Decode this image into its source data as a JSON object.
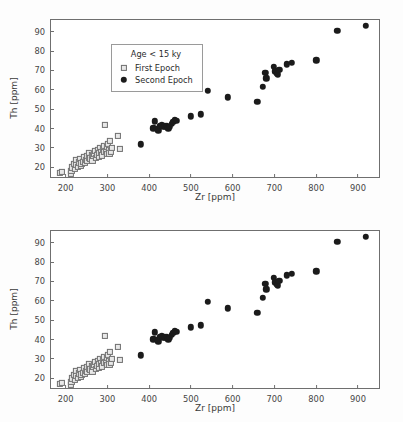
{
  "figure": {
    "axis_color": "#6f6f6f",
    "first_epoch_color": "#e8e8e8",
    "first_epoch_edge": "#707070",
    "second_epoch_color": "#1b1b1b"
  },
  "axes": {
    "xlabel": "Zr [ppm]",
    "ylabel": "Th [ppm]",
    "xticks": [
      200,
      300,
      400,
      500,
      600,
      700,
      800,
      900
    ],
    "yticks": [
      20,
      30,
      40,
      50,
      60,
      70,
      80,
      90
    ],
    "xlim": [
      165,
      955
    ],
    "ylim": [
      14,
      96
    ]
  },
  "legend": {
    "title": "Age < 15 ky",
    "entries": [
      {
        "label": "First Epoch",
        "marker": "open-square-marker"
      },
      {
        "label": "Second Epoch",
        "marker": "filled-circle-marker"
      }
    ]
  },
  "chart_data": {
    "type": "scatter",
    "title": "",
    "xlabel": "Zr [ppm]",
    "ylabel": "Th [ppm]",
    "xlim": [
      165,
      955
    ],
    "ylim": [
      14,
      96
    ],
    "grid": false,
    "panels": [
      {
        "name": "top-panel",
        "legend_position": "upper left",
        "legend_framed": true
      },
      {
        "name": "bottom-panel",
        "legend_position": "lower right",
        "legend_framed": false
      }
    ],
    "series": [
      {
        "name": "First Epoch",
        "marker": "square",
        "filled": false,
        "points": [
          [
            186,
            17.0
          ],
          [
            191,
            17.6
          ],
          [
            212,
            16.8
          ],
          [
            214,
            18.0
          ],
          [
            216,
            20.0
          ],
          [
            219,
            21.6
          ],
          [
            222,
            19.4
          ],
          [
            224,
            23.8
          ],
          [
            226,
            21.2
          ],
          [
            229,
            20.4
          ],
          [
            231,
            22.6
          ],
          [
            234,
            24.2
          ],
          [
            236,
            21.0
          ],
          [
            238,
            22.0
          ],
          [
            241,
            23.0
          ],
          [
            243,
            25.4
          ],
          [
            246,
            22.4
          ],
          [
            248,
            24.0
          ],
          [
            250,
            26.0
          ],
          [
            252,
            23.2
          ],
          [
            255,
            25.0
          ],
          [
            257,
            27.6
          ],
          [
            259,
            24.6
          ],
          [
            262,
            26.4
          ],
          [
            264,
            23.6
          ],
          [
            266,
            25.8
          ],
          [
            268,
            27.0
          ],
          [
            271,
            28.4
          ],
          [
            273,
            24.8
          ],
          [
            275,
            26.6
          ],
          [
            277,
            29.2
          ],
          [
            279,
            25.2
          ],
          [
            281,
            27.4
          ],
          [
            283,
            30.0
          ],
          [
            285,
            28.0
          ],
          [
            287,
            26.2
          ],
          [
            289,
            29.6
          ],
          [
            291,
            31.0
          ],
          [
            293,
            27.8
          ],
          [
            295,
            42.0
          ],
          [
            296,
            28.6
          ],
          [
            298,
            30.6
          ],
          [
            300,
            26.8
          ],
          [
            302,
            32.2
          ],
          [
            303,
            29.0
          ],
          [
            305,
            27.2
          ],
          [
            306,
            33.8
          ],
          [
            308,
            28.2
          ],
          [
            310,
            30.2
          ],
          [
            325,
            36.4
          ],
          [
            330,
            29.6
          ]
        ]
      },
      {
        "name": "Second Epoch",
        "marker": "circle",
        "filled": true,
        "points": [
          [
            380,
            31.8
          ],
          [
            410,
            40.2
          ],
          [
            414,
            43.8
          ],
          [
            418,
            40.0
          ],
          [
            422,
            39.2
          ],
          [
            426,
            41.4
          ],
          [
            430,
            41.6
          ],
          [
            434,
            40.8
          ],
          [
            438,
            41.2
          ],
          [
            442,
            41.4
          ],
          [
            446,
            40.2
          ],
          [
            450,
            41.0
          ],
          [
            454,
            42.6
          ],
          [
            458,
            43.4
          ],
          [
            462,
            44.4
          ],
          [
            466,
            44.0
          ],
          [
            500,
            46.4
          ],
          [
            524,
            47.4
          ],
          [
            540,
            59.6
          ],
          [
            588,
            56.2
          ],
          [
            659,
            53.8
          ],
          [
            672,
            61.6
          ],
          [
            678,
            68.8
          ],
          [
            680,
            66.0
          ],
          [
            698,
            72.0
          ],
          [
            702,
            69.6
          ],
          [
            705,
            68.4
          ],
          [
            708,
            68.0
          ],
          [
            712,
            70.4
          ],
          [
            730,
            73.2
          ],
          [
            742,
            73.8
          ],
          [
            800,
            75.2
          ],
          [
            850,
            90.4
          ],
          [
            918,
            93.0
          ]
        ]
      }
    ]
  }
}
